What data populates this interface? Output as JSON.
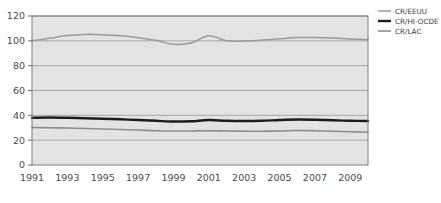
{
  "chart_data": {
    "type": "line",
    "title": "",
    "subtitle": "",
    "xlabel": "",
    "ylabel": "",
    "xlim": [
      1991,
      2010
    ],
    "ylim": [
      0,
      120
    ],
    "grid": true,
    "legend_position": "right",
    "x": [
      1991,
      1992,
      1993,
      1994,
      1995,
      1996,
      1997,
      1998,
      1999,
      2000,
      2001,
      2002,
      2003,
      2004,
      2005,
      2006,
      2007,
      2008,
      2009,
      2010
    ],
    "xtick_labels": [
      "1991",
      "1993",
      "1995",
      "1997",
      "1999",
      "2001",
      "2003",
      "2005",
      "2007",
      "2009"
    ],
    "xticks": [
      1991,
      1993,
      1995,
      1997,
      1999,
      2001,
      2003,
      2005,
      2007,
      2009
    ],
    "ytick_labels": [
      "0",
      "20",
      "40",
      "60",
      "80",
      "100",
      "120"
    ],
    "yticks": [
      0,
      20,
      40,
      60,
      80,
      100,
      120
    ],
    "series": [
      {
        "name": "CR/EEUU",
        "color": "#9a9a9a",
        "width": 1.5,
        "values": [
          100.0,
          102.0,
          104.2,
          105.2,
          105.0,
          104.0,
          102.4,
          100.4,
          97.2,
          98.2,
          104.0,
          100.0,
          99.8,
          100.6,
          101.6,
          102.6,
          102.6,
          102.2,
          101.4,
          101.0
        ]
      },
      {
        "name": "CR/HI-OCDE",
        "color": "#1c1c1c",
        "width": 2.4,
        "values": [
          38.0,
          38.2,
          38.0,
          37.6,
          37.2,
          36.8,
          36.2,
          35.6,
          35.0,
          35.2,
          36.2,
          35.6,
          35.4,
          35.6,
          36.2,
          36.6,
          36.4,
          36.0,
          35.6,
          35.4
        ]
      },
      {
        "name": "CR/LAC",
        "color": "#8d8d8d",
        "width": 1.6,
        "values": [
          30.2,
          30.0,
          29.8,
          29.4,
          29.0,
          28.6,
          28.2,
          27.6,
          27.4,
          27.4,
          27.6,
          27.4,
          27.2,
          27.2,
          27.4,
          27.8,
          27.6,
          27.2,
          26.8,
          26.4
        ]
      }
    ]
  },
  "plot": {
    "background_color": "#e3e3e3",
    "border_color": "#7d7d7d",
    "gridline_color": "#a8a8a8",
    "axis_color": "#6e6e6e",
    "page_background": "#ffffff"
  },
  "legend": {
    "items": [
      {
        "label": "CR/EEUU",
        "swatch": "legend-swatch-line"
      },
      {
        "label": "CR/HI-OCDE",
        "swatch": "legend-swatch-line"
      },
      {
        "label": "CR/LAC",
        "swatch": "legend-swatch-line"
      }
    ]
  }
}
